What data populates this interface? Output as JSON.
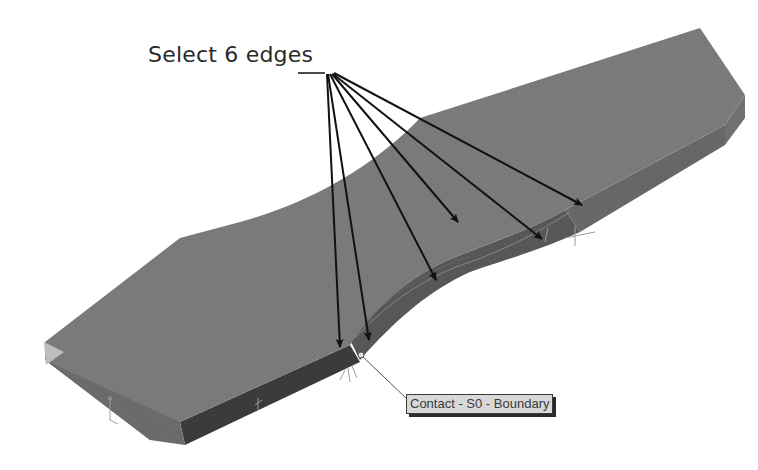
{
  "annotation": {
    "text": "Select 6 edges",
    "arrow_count": 6
  },
  "callout": {
    "label": "Contact - S0 - Boundary"
  },
  "model": {
    "description": "3D solid part (dog-bone style slab) with curved fillet transition region",
    "top_face_color": "#7c7c7c",
    "side_face_color": "#5e5e5e",
    "dark_side_color": "#3e3e3e",
    "end_face_color": "#b8b8b8",
    "arrow_color": "#111111"
  }
}
